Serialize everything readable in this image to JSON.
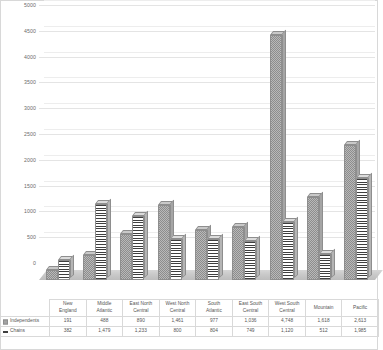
{
  "chart_data": {
    "type": "bar",
    "title": "",
    "xlabel": "",
    "ylabel": "",
    "ylim": [
      0,
      5000
    ],
    "yticks": [
      0,
      500,
      1000,
      1500,
      2000,
      2500,
      3000,
      3500,
      4000,
      4500,
      5000
    ],
    "ytick_labels": [
      "0",
      "500",
      "1000",
      "1500",
      "2000",
      "2500",
      "3000",
      "3500",
      "4000",
      "4500",
      "5000"
    ],
    "grid": true,
    "legend_position": "data-table",
    "categories": [
      "New England",
      "Middle Atlantic",
      "East North Central",
      "West North Central",
      "South Atlantic",
      "East South Central",
      "West South Central",
      "Mountain",
      "Pacific"
    ],
    "category_lines": [
      [
        "New",
        "England"
      ],
      [
        "Middle",
        "Atlantic"
      ],
      [
        "East North",
        "Central"
      ],
      [
        "West North",
        "Central"
      ],
      [
        "South",
        "Atlantic"
      ],
      [
        "East South",
        "Central"
      ],
      [
        "West South",
        "Central"
      ],
      [
        "Mountain",
        ""
      ],
      [
        "Pacific",
        ""
      ]
    ],
    "series": [
      {
        "name": "Independents",
        "key": "checker",
        "values": [
          191,
          488,
          890,
          1461,
          977,
          1036,
          4748,
          1618,
          2613
        ],
        "labels": [
          "191",
          "488",
          "890",
          "1,461",
          "977",
          "1,036",
          "4,748",
          "1,618",
          "2,613"
        ]
      },
      {
        "name": "Chains",
        "key": "stripes",
        "values": [
          382,
          1479,
          1233,
          800,
          804,
          749,
          1120,
          512,
          1985
        ],
        "labels": [
          "382",
          "1,479",
          "1,233",
          "800",
          "804",
          "749",
          "1,120",
          "512",
          "1,985"
        ]
      }
    ]
  },
  "table": {
    "row_labels": [
      "Independents",
      "Chains"
    ]
  },
  "colors": {
    "grid": "#e4e4e4",
    "axis_text": "#6b6b6b",
    "table_border": "#d9d9d9",
    "series_a": "#b9b9b9",
    "series_b": "#3f3f3f",
    "background": "#ffffff"
  }
}
